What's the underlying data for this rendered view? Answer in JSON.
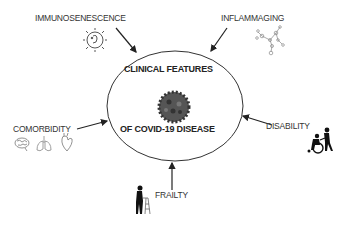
{
  "center": {
    "title_line1": "CLINICAL FEATURES",
    "title_line2": "OF COVID-19 DISEASE",
    "icon": "coronavirus-icon"
  },
  "factors": [
    {
      "label": "IMMUNOSENESCENCE",
      "icon": "immune-cell-icon"
    },
    {
      "label": "INFLAMMAGING",
      "icon": "molecule-network-icon"
    },
    {
      "label": "COMORBIDITY",
      "icon": "brain-lungs-heart-icons"
    },
    {
      "label": "DISABILITY",
      "icon": "wheelchair-person-icon"
    },
    {
      "label": "FRAILTY",
      "icon": "walker-person-icon"
    }
  ]
}
